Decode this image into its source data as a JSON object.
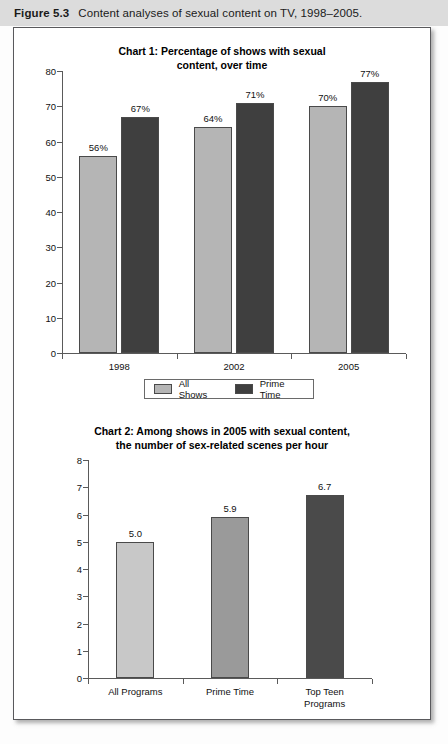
{
  "caption": {
    "label": "Figure 5.3",
    "text": "Content analyses of sexual content on TV, 1998–2005."
  },
  "colors": {
    "chart1_light": "#b5b5b5",
    "chart1_dark": "#3f3f3f",
    "chart2_light": "#c8c8c8",
    "chart2_medium": "#9a9a9a",
    "chart2_dark": "#4a4a4a",
    "band": "#dcdcdc",
    "border": "#59595c",
    "axis": "#5a5a5a"
  },
  "legend": {
    "items": [
      {
        "label": "All Shows",
        "color": "#b5b5b5"
      },
      {
        "label": "Prime Time",
        "color": "#3f3f3f"
      }
    ]
  },
  "chart_data": [
    {
      "type": "bar",
      "title": "Chart 1: Percentage of shows with sexual content, over time",
      "title_line1": "Chart 1: Percentage of shows with sexual",
      "title_line2": "content, over time",
      "categories": [
        "1998",
        "2002",
        "2005"
      ],
      "series": [
        {
          "name": "All Shows",
          "values": [
            56,
            64,
            70
          ],
          "labels": [
            "56%",
            "64%",
            "70%"
          ],
          "color": "#b5b5b5"
        },
        {
          "name": "Prime Time",
          "values": [
            67,
            71,
            77
          ],
          "labels": [
            "67%",
            "71%",
            "77%"
          ],
          "color": "#3f3f3f"
        }
      ],
      "ylim": [
        0,
        80
      ],
      "yticks": [
        0,
        10,
        20,
        30,
        40,
        50,
        60,
        70,
        80
      ],
      "ytick_labels": [
        "0",
        "10",
        "20",
        "30",
        "40",
        "50",
        "60",
        "70",
        "80"
      ],
      "xlabel": "",
      "ylabel": "",
      "grid": false,
      "legend_position": "bottom"
    },
    {
      "type": "bar",
      "title": "Chart 2: Among shows in 2005 with sexual content, the number of sex-related scenes per hour",
      "title_line1": "Chart 2: Among shows in 2005 with sexual content,",
      "title_line2": "the number of sex-related scenes per hour",
      "categories": [
        "All Programs",
        "Prime Time",
        "Top Teen Programs"
      ],
      "category_lines": [
        [
          "All Programs"
        ],
        [
          "Prime Time"
        ],
        [
          "Top Teen",
          "Programs"
        ]
      ],
      "values": [
        5.0,
        5.9,
        6.7
      ],
      "labels": [
        "5.0",
        "5.9",
        "6.7"
      ],
      "bar_colors": [
        "#c8c8c8",
        "#9a9a9a",
        "#4a4a4a"
      ],
      "ylim": [
        0,
        8
      ],
      "yticks": [
        0,
        1,
        2,
        3,
        4,
        5,
        6,
        7,
        8
      ],
      "ytick_labels": [
        "0",
        "1",
        "2",
        "3",
        "4",
        "5",
        "6",
        "7",
        "8"
      ],
      "xlabel": "",
      "ylabel": "",
      "grid": false,
      "legend_position": "none"
    }
  ]
}
